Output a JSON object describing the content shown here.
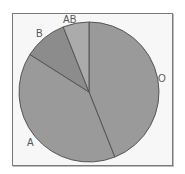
{
  "chart_data": {
    "type": "pie",
    "title": "",
    "categories": [
      "O",
      "A",
      "B",
      "AB"
    ],
    "values": [
      44,
      40,
      10,
      6
    ],
    "unit": "percent (estimated from slice angles)",
    "start_angle": "12 o'clock",
    "direction": "clockwise",
    "legend": "none (direct labels)",
    "colors": [
      "#9a9a9a",
      "#9a9a9a",
      "#8c8c8c",
      "#ababab"
    ]
  },
  "labels": {
    "O": "O",
    "A": "A",
    "B": "B",
    "AB": "AB"
  }
}
